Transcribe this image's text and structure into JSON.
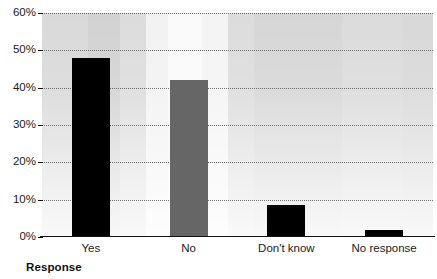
{
  "chart_data": {
    "type": "bar",
    "title": "",
    "xlabel": "Response",
    "ylabel": "",
    "categories": [
      "Yes",
      "No",
      "Don't know",
      "No response"
    ],
    "values": [
      48,
      42,
      8.5,
      2
    ],
    "value_labels": [
      "48%",
      "42%",
      "8.5%",
      "2%"
    ],
    "bar_colors": [
      "#000000",
      "#666666",
      "#000000",
      "#000000"
    ],
    "ylim": [
      0,
      60
    ],
    "ytick_values": [
      0,
      10,
      20,
      30,
      40,
      50,
      60
    ],
    "ytick_labels": [
      "0%",
      "10%",
      "20%",
      "30%",
      "40%",
      "50%",
      "60%"
    ],
    "grid": true,
    "grid_style": "dotted",
    "grid_axis": "y",
    "legend": false,
    "legend_position": "none",
    "plot_background": "banded-gray-gradient"
  },
  "axes": {
    "x_title": "Response",
    "y_ticks": [
      {
        "label": "60%",
        "value": 60
      },
      {
        "label": "50%",
        "value": 50
      },
      {
        "label": "40%",
        "value": 40
      },
      {
        "label": "30%",
        "value": 30
      },
      {
        "label": "20%",
        "value": 20
      },
      {
        "label": "10%",
        "value": 10
      },
      {
        "label": "0%",
        "value": 0
      }
    ],
    "x_categories": [
      "Yes",
      "No",
      "Don't know",
      "No response"
    ]
  },
  "colors": {
    "bar_dark": "#000000",
    "bar_gray": "#666666",
    "axis": "#111111",
    "gridline": "#5a5a5a",
    "text": "#1c1c1c",
    "plot_bg_light": "#fafafa",
    "plot_bg_dark": "#d6d6d6"
  },
  "clipped_title": ""
}
